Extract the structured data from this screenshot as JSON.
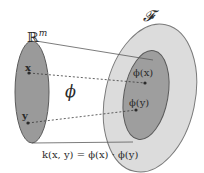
{
  "diagram": {
    "input_space": {
      "label": "ℝ",
      "superscript": "m"
    },
    "feature_space": {
      "label": "𝓕"
    },
    "points": {
      "x": "x",
      "y": "y"
    },
    "mapping": {
      "label": "ϕ"
    },
    "mapped_points": {
      "phi_x": "ϕ(x)",
      "phi_y": "ϕ(y)"
    },
    "equation": "k(x, y) = ϕ(x) · ϕ(y)",
    "colors": {
      "input_space_fill": "#9a9a9a",
      "feature_space_outer_fill": "#dcdcdc",
      "feature_space_inner_fill": "#9e9e9e",
      "outline": "#5a5a5a",
      "point": "#2a2a2a"
    }
  }
}
